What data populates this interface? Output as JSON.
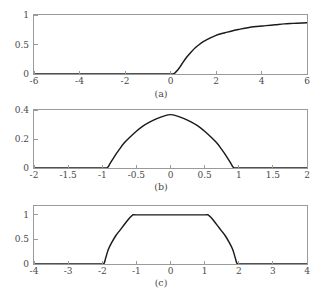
{
  "figure": {
    "background_color": "#ffffff",
    "axis_color": "#9a9a9a",
    "curve_color": "#1a1a1a",
    "label_color": "#4a4a4a"
  },
  "panels": [
    {
      "caption": "(a)",
      "xticklabels": [
        "-6",
        "-4",
        "-2",
        "0",
        "2",
        "4",
        "6"
      ],
      "yticklabels": [
        "0",
        "0.5",
        "1"
      ]
    },
    {
      "caption": "(b)",
      "xticklabels": [
        "-2",
        "-1.5",
        "-1",
        "-0.5",
        "0",
        "0.5",
        "1",
        "1.5",
        "2"
      ],
      "yticklabels": [
        "0",
        "0.2",
        "0.4"
      ]
    },
    {
      "caption": "(c)",
      "xticklabels": [
        "-4",
        "-3",
        "-2",
        "-1",
        "0",
        "1",
        "2",
        "3",
        "4"
      ],
      "yticklabels": [
        "0",
        "0.5",
        "1"
      ]
    }
  ],
  "chart_data": [
    {
      "type": "line",
      "title": "",
      "subtitle": "",
      "xlabel": "",
      "ylabel": "",
      "caption": "(a)",
      "grid": false,
      "legend": false,
      "xlim": [
        -6,
        6
      ],
      "ylim": [
        0,
        1
      ],
      "xticks": [
        -6,
        -4,
        -2,
        0,
        2,
        4,
        6
      ],
      "yticks": [
        0,
        0.5,
        1
      ],
      "series": [
        {
          "name": "curve-a",
          "x": [
            -6,
            -5,
            -4,
            -3,
            -2,
            -1,
            -0.5,
            -0.2,
            0,
            0.1,
            0.2,
            0.3,
            0.4,
            0.5,
            0.7,
            0.9,
            1.1,
            1.3,
            1.5,
            1.8,
            2.1,
            2.4,
            2.7,
            3,
            3.4,
            3.8,
            4.2,
            4.6,
            5,
            5.4,
            5.8,
            6
          ],
          "y": [
            0,
            0,
            0,
            0,
            0,
            0,
            0,
            0,
            0,
            0,
            0.02,
            0.06,
            0.11,
            0.17,
            0.28,
            0.37,
            0.45,
            0.51,
            0.56,
            0.62,
            0.67,
            0.7,
            0.73,
            0.755,
            0.785,
            0.805,
            0.82,
            0.835,
            0.85,
            0.858,
            0.866,
            0.87
          ]
        }
      ]
    },
    {
      "type": "line",
      "title": "",
      "subtitle": "",
      "xlabel": "",
      "ylabel": "",
      "caption": "(b)",
      "grid": false,
      "legend": false,
      "xlim": [
        -2,
        2
      ],
      "ylim": [
        0,
        0.4
      ],
      "xticks": [
        -2,
        -1.5,
        -1,
        -0.5,
        0,
        0.5,
        1,
        1.5,
        2
      ],
      "yticks": [
        0,
        0.2,
        0.4
      ],
      "series": [
        {
          "name": "curve-b",
          "x": [
            -2,
            -1.5,
            -1.1,
            -0.95,
            -0.92,
            -0.88,
            -0.82,
            -0.75,
            -0.68,
            -0.6,
            -0.5,
            -0.4,
            -0.3,
            -0.2,
            -0.1,
            0,
            0.1,
            0.2,
            0.3,
            0.4,
            0.5,
            0.6,
            0.68,
            0.75,
            0.82,
            0.88,
            0.92,
            0.95,
            1.1,
            1.5,
            2
          ],
          "y": [
            0,
            0,
            0,
            0,
            0.005,
            0.035,
            0.08,
            0.128,
            0.172,
            0.21,
            0.253,
            0.29,
            0.318,
            0.34,
            0.358,
            0.368,
            0.358,
            0.34,
            0.318,
            0.29,
            0.253,
            0.21,
            0.172,
            0.128,
            0.08,
            0.035,
            0.005,
            0,
            0,
            0,
            0
          ]
        }
      ]
    },
    {
      "type": "line",
      "title": "",
      "subtitle": "",
      "xlabel": "",
      "ylabel": "",
      "caption": "(c)",
      "grid": false,
      "legend": false,
      "xlim": [
        -4,
        4
      ],
      "ylim": [
        0,
        1.18
      ],
      "xticks": [
        -4,
        -3,
        -2,
        -1,
        0,
        1,
        2,
        3,
        4
      ],
      "yticks": [
        0,
        0.5,
        1
      ],
      "series": [
        {
          "name": "curve-c",
          "x": [
            -4,
            -3,
            -2.4,
            -2.05,
            -1.95,
            -1.9,
            -1.82,
            -1.72,
            -1.6,
            -1.5,
            -1.4,
            -1.3,
            -1.22,
            -1.15,
            -1.1,
            -1.0,
            0,
            1.0,
            1.1,
            1.15,
            1.22,
            1.3,
            1.4,
            1.5,
            1.6,
            1.72,
            1.82,
            1.9,
            1.95,
            2.05,
            2.4,
            3,
            4
          ],
          "y": [
            0,
            0,
            0,
            0,
            0.01,
            0.12,
            0.3,
            0.44,
            0.58,
            0.67,
            0.76,
            0.85,
            0.92,
            0.97,
            1.0,
            1.0,
            1.0,
            1.0,
            1.0,
            0.97,
            0.92,
            0.85,
            0.76,
            0.67,
            0.58,
            0.44,
            0.3,
            0.12,
            0.01,
            0,
            0,
            0,
            0
          ]
        }
      ]
    }
  ]
}
